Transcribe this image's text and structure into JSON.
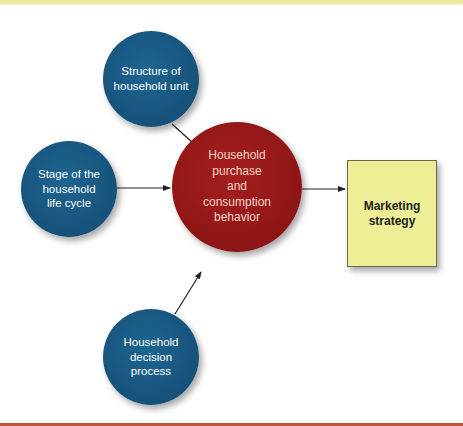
{
  "diagram": {
    "nodes": {
      "structure": {
        "label": "Structure of\nhousehold unit",
        "shape": "circle",
        "color": "#1a5a85"
      },
      "life_cycle": {
        "label": "Stage of the\nhousehold\nlife cycle",
        "shape": "circle",
        "color": "#1a5a85"
      },
      "decision": {
        "label": "Household\ndecision\nprocess",
        "shape": "circle",
        "color": "#1a5a85"
      },
      "behavior": {
        "label": "Household\npurchase\nand\nconsumption\nbehavior",
        "shape": "circle",
        "color": "#951818"
      },
      "strategy": {
        "label": "Marketing\nstrategy",
        "shape": "rectangle",
        "color": "#eeee96"
      }
    },
    "edges": [
      {
        "from": "structure",
        "to": "behavior"
      },
      {
        "from": "life_cycle",
        "to": "behavior"
      },
      {
        "from": "decision",
        "to": "behavior"
      },
      {
        "from": "behavior",
        "to": "strategy"
      }
    ],
    "colors": {
      "top_band": "#ecec9a",
      "bottom_band": "#c5523a",
      "arrow": "#222222"
    }
  }
}
